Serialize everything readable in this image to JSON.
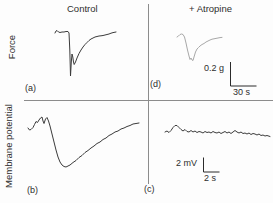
{
  "figure": {
    "columns": [
      {
        "title": "Control"
      },
      {
        "title": "+ Atropine"
      }
    ],
    "rows": [
      {
        "label": "Force"
      },
      {
        "label": "Membrane potential"
      }
    ],
    "panels": [
      {
        "id": "a",
        "label": "(a)"
      },
      {
        "id": "d",
        "label": "(d)"
      },
      {
        "id": "b",
        "label": "(b)"
      },
      {
        "id": "c",
        "label": "(c)"
      }
    ],
    "scale_bars": {
      "force": {
        "amplitude": "0.2 g",
        "time": "30 s"
      },
      "membrane": {
        "amplitude": "2 mV",
        "time": "2 s"
      }
    }
  },
  "colors": {
    "trace_dark": "#3b3b3b",
    "trace_light": "#a8a8a8",
    "divider": "#8c8c8c",
    "scalebar": "#2b2b2b"
  },
  "chart_data": {
    "type": "line",
    "layout": "2x2 panels; columns: Control vs + Atropine; rows: Force vs Membrane potential; no axes, scale bars only",
    "scale_bars": {
      "force_vertical": "0.2 g",
      "force_horizontal": "30 s",
      "membrane_vertical": "2 mV",
      "membrane_horizontal": "2 s"
    },
    "traces": [
      {
        "id": "a",
        "name": "force-control",
        "panel": "(a)",
        "color": "#3b3b3b",
        "points": [
          [
            55,
            33
          ],
          [
            56,
            31
          ],
          [
            57,
            30.5
          ],
          [
            58.5,
            32
          ],
          [
            60,
            32.5
          ],
          [
            62,
            32
          ],
          [
            64,
            32
          ],
          [
            66,
            31.5
          ],
          [
            68,
            31.5
          ],
          [
            69,
            33
          ],
          [
            69.8,
            50
          ],
          [
            70.5,
            76
          ],
          [
            71.3,
            62
          ],
          [
            72,
            54
          ],
          [
            72.8,
            57
          ],
          [
            73.5,
            62
          ],
          [
            74.2,
            64.5
          ],
          [
            75.5,
            62
          ],
          [
            77,
            58
          ],
          [
            79,
            53.5
          ],
          [
            81,
            50
          ],
          [
            83,
            47
          ],
          [
            85,
            44.5
          ],
          [
            87,
            42.5
          ],
          [
            89,
            40.5
          ],
          [
            91,
            39
          ],
          [
            93,
            38
          ],
          [
            95,
            37
          ],
          [
            97,
            36.5
          ],
          [
            99,
            36
          ],
          [
            101,
            35.8
          ],
          [
            103,
            35.5
          ],
          [
            105,
            35
          ],
          [
            107,
            34.5
          ],
          [
            109,
            34
          ],
          [
            111,
            33.2
          ],
          [
            113,
            32.6
          ],
          [
            115,
            32.2
          ],
          [
            116,
            32
          ]
        ]
      },
      {
        "id": "d",
        "name": "force-atropine",
        "panel": "(d)",
        "color": "#a8a8a8",
        "points": [
          [
            177,
            37
          ],
          [
            178.5,
            36
          ],
          [
            180,
            34.5
          ],
          [
            181.5,
            34
          ],
          [
            183,
            34.5
          ],
          [
            184.5,
            37
          ],
          [
            186,
            43
          ],
          [
            187.5,
            50
          ],
          [
            189,
            56
          ],
          [
            190,
            59.5
          ],
          [
            191,
            58
          ],
          [
            192,
            60
          ],
          [
            193,
            60.5
          ],
          [
            194,
            57
          ],
          [
            195.5,
            52
          ],
          [
            197,
            49
          ],
          [
            198.5,
            47.5
          ],
          [
            200,
            46
          ],
          [
            202,
            44.5
          ],
          [
            204,
            43.5
          ],
          [
            206,
            42
          ],
          [
            208,
            41
          ],
          [
            210,
            40
          ],
          [
            212,
            39.2
          ],
          [
            214,
            38.8
          ],
          [
            216,
            38.4
          ],
          [
            218,
            38
          ],
          [
            220,
            37.6
          ],
          [
            222,
            37.4
          ]
        ]
      },
      {
        "id": "b",
        "name": "membrane-potential-control",
        "panel": "(b)",
        "color": "#3b3b3b",
        "points": [
          [
            28,
            128
          ],
          [
            29.5,
            130
          ],
          [
            31,
            129.5
          ],
          [
            33,
            127.5
          ],
          [
            34.5,
            124.5
          ],
          [
            36,
            121.5
          ],
          [
            37.5,
            122.5
          ],
          [
            39,
            120
          ],
          [
            40.5,
            118
          ],
          [
            42,
            117
          ],
          [
            43,
            121
          ],
          [
            44,
            123.5
          ],
          [
            45.5,
            119
          ],
          [
            47,
            117.5
          ],
          [
            48.5,
            121
          ],
          [
            50,
            126
          ],
          [
            52,
            134
          ],
          [
            54,
            142
          ],
          [
            56,
            150
          ],
          [
            58,
            157
          ],
          [
            60,
            162
          ],
          [
            62,
            165
          ],
          [
            64,
            166.5
          ],
          [
            66,
            167
          ],
          [
            68,
            166
          ],
          [
            70,
            165
          ],
          [
            73,
            162.5
          ],
          [
            76,
            160.5
          ],
          [
            79,
            157.5
          ],
          [
            82,
            155.5
          ],
          [
            85,
            152.5
          ],
          [
            88,
            150.5
          ],
          [
            91,
            148
          ],
          [
            94,
            146
          ],
          [
            97,
            143.5
          ],
          [
            100,
            142
          ],
          [
            103,
            139.5
          ],
          [
            106,
            138
          ],
          [
            109,
            135.5
          ],
          [
            112,
            134
          ],
          [
            115,
            132
          ],
          [
            118,
            131
          ],
          [
            121,
            129
          ],
          [
            124,
            128
          ],
          [
            127,
            126.5
          ],
          [
            130,
            125.5
          ],
          [
            133,
            124
          ],
          [
            136,
            123.5
          ],
          [
            139,
            123
          ]
        ]
      },
      {
        "id": "c",
        "name": "membrane-potential-atropine",
        "panel": "(c)",
        "color": "#3b3b3b",
        "points": [
          [
            165,
            132
          ],
          [
            167,
            131
          ],
          [
            169,
            132.5
          ],
          [
            171,
            130.5
          ],
          [
            173,
            127.5
          ],
          [
            175,
            125.5
          ],
          [
            177,
            125.5
          ],
          [
            179,
            127.5
          ],
          [
            181,
            129.5
          ],
          [
            183,
            131
          ],
          [
            185,
            129.5
          ],
          [
            187,
            131.5
          ],
          [
            189,
            132
          ],
          [
            191,
            130.5
          ],
          [
            193,
            132
          ],
          [
            195,
            131
          ],
          [
            197,
            132.5
          ],
          [
            199,
            131.5
          ],
          [
            201,
            132
          ],
          [
            203,
            133
          ],
          [
            205,
            131.5
          ],
          [
            207,
            132.5
          ],
          [
            209,
            132
          ],
          [
            211,
            133
          ],
          [
            213,
            131.5
          ],
          [
            215,
            132.5
          ],
          [
            217,
            133
          ],
          [
            219,
            132
          ],
          [
            221,
            133.5
          ],
          [
            223,
            132.5
          ],
          [
            225,
            131.5
          ],
          [
            227,
            133
          ],
          [
            229,
            132
          ],
          [
            231,
            133.5
          ],
          [
            233,
            132
          ],
          [
            235,
            130.5
          ],
          [
            237,
            132
          ],
          [
            239,
            133
          ],
          [
            241,
            132
          ],
          [
            243,
            133.5
          ],
          [
            245,
            133
          ],
          [
            247,
            134
          ],
          [
            249,
            133
          ],
          [
            251,
            134.5
          ],
          [
            253,
            133.5
          ],
          [
            255,
            134
          ],
          [
            257,
            135
          ],
          [
            259,
            134
          ],
          [
            261,
            135.5
          ],
          [
            263,
            135
          ],
          [
            265,
            136
          ],
          [
            267,
            135.5
          ],
          [
            270,
            136.5
          ]
        ]
      }
    ]
  }
}
